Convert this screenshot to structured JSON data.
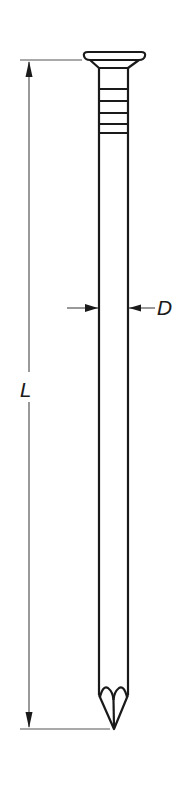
{
  "diagram": {
    "labels": {
      "diameter": "D",
      "length": "L"
    },
    "colors": {
      "line": "#1a1a1a",
      "dimension_line": "#555555",
      "background": "#ffffff"
    },
    "features": {
      "head": "countersunk flat head",
      "shank_rings": 5,
      "point": "diamond point"
    }
  }
}
